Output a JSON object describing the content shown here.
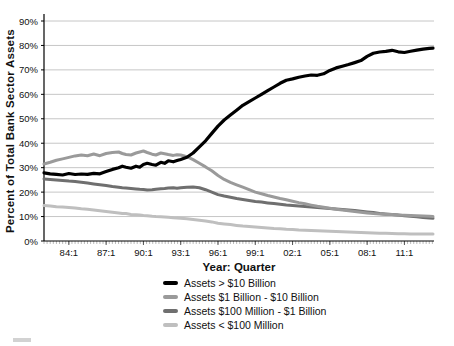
{
  "chart_data": {
    "type": "line",
    "title": "",
    "xlabel": "Year: Quarter",
    "ylabel": "Percent of Total Bank Sector Assets",
    "ylim": [
      0,
      90
    ],
    "y_tick_step": 10,
    "y_tick_labels": [
      "0%",
      "10%",
      "20%",
      "30%",
      "40%",
      "50%",
      "60%",
      "70%",
      "80%",
      "90%"
    ],
    "x_tick_labels": [
      "84:1",
      "87:1",
      "90:1",
      "93:1",
      "96:1",
      "99:1",
      "02:1",
      "05:1",
      "08:1",
      "11:1"
    ],
    "x_tick_values": [
      1984,
      1987,
      1990,
      1993,
      1996,
      1999,
      2002,
      2005,
      2008,
      2011
    ],
    "x_range": [
      1982.0,
      2013.3
    ],
    "grid": "horizontal",
    "legend_position": "bottom",
    "axis_color": "#000000",
    "grid_color": "#c6c6c6",
    "minor_tick_color": "#aaaaaa",
    "x": [
      1982.0,
      1982.5,
      1983.0,
      1983.5,
      1984.0,
      1984.5,
      1985.0,
      1985.5,
      1986.0,
      1986.5,
      1987.0,
      1987.5,
      1988.0,
      1988.3,
      1988.6,
      1989.0,
      1989.4,
      1989.7,
      1990.0,
      1990.3,
      1990.7,
      1991.0,
      1991.4,
      1991.7,
      1992.0,
      1992.4,
      1992.7,
      1993.0,
      1993.5,
      1994.0,
      1994.5,
      1995.0,
      1995.5,
      1996.0,
      1996.5,
      1997.0,
      1997.5,
      1998.0,
      1998.5,
      1999.0,
      1999.5,
      2000.0,
      2000.5,
      2001.0,
      2001.5,
      2002.0,
      2002.5,
      2003.0,
      2003.5,
      2004.0,
      2004.5,
      2005.0,
      2005.5,
      2006.0,
      2006.5,
      2007.0,
      2007.5,
      2008.0,
      2008.5,
      2009.0,
      2009.5,
      2010.0,
      2010.5,
      2011.0,
      2011.5,
      2012.0,
      2012.5,
      2013.0,
      2013.3
    ],
    "series": [
      {
        "name": "Assets > $10 Billion",
        "color": "#000000",
        "width": 3.2,
        "values": [
          27.9,
          27.5,
          27.3,
          27.0,
          27.6,
          27.2,
          27.4,
          27.3,
          27.7,
          27.5,
          28.4,
          29.3,
          30.0,
          30.6,
          30.2,
          29.8,
          30.6,
          30.2,
          31.3,
          31.8,
          31.3,
          31.0,
          32.2,
          31.8,
          32.8,
          32.4,
          32.9,
          33.4,
          34.3,
          36.0,
          38.5,
          41.0,
          44.0,
          47.0,
          49.5,
          51.5,
          53.5,
          55.5,
          57.0,
          58.5,
          60.0,
          61.5,
          63.0,
          64.5,
          65.8,
          66.3,
          67.0,
          67.5,
          67.9,
          67.8,
          68.4,
          69.8,
          70.8,
          71.5,
          72.2,
          73.0,
          73.8,
          75.5,
          76.8,
          77.3,
          77.6,
          78.0,
          77.4,
          77.1,
          77.6,
          78.1,
          78.5,
          78.8,
          78.9
        ]
      },
      {
        "name": "Assets $1 Billion - $10 Billion",
        "color": "#9a9a9a",
        "width": 3.0,
        "values": [
          31.5,
          32.2,
          33.0,
          33.6,
          34.2,
          34.8,
          35.2,
          34.9,
          35.6,
          34.9,
          35.8,
          36.2,
          36.4,
          35.8,
          35.4,
          35.2,
          36.0,
          36.4,
          36.8,
          36.2,
          35.5,
          35.2,
          36.0,
          35.7,
          35.4,
          35.0,
          35.3,
          35.2,
          34.5,
          33.3,
          31.8,
          30.3,
          28.7,
          26.8,
          25.2,
          24.0,
          23.0,
          22.0,
          21.0,
          20.0,
          19.3,
          18.6,
          18.0,
          17.4,
          16.9,
          16.3,
          15.7,
          15.2,
          14.7,
          14.2,
          13.8,
          13.4,
          13.0,
          12.7,
          12.4,
          12.1,
          11.8,
          11.5,
          11.2,
          11.0,
          10.9,
          10.8,
          10.6,
          10.5,
          10.4,
          10.3,
          10.2,
          10.1,
          10.0
        ]
      },
      {
        "name": "Assets $100 Million - $1 Billion",
        "color": "#6f6f6f",
        "width": 3.0,
        "values": [
          25.4,
          25.2,
          25.0,
          24.8,
          24.5,
          24.3,
          24.0,
          23.7,
          23.3,
          23.0,
          22.7,
          22.3,
          22.0,
          21.8,
          21.7,
          21.5,
          21.3,
          21.2,
          21.1,
          20.9,
          21.0,
          21.2,
          21.4,
          21.5,
          21.7,
          21.8,
          21.6,
          21.8,
          22.0,
          22.1,
          21.8,
          21.0,
          20.0,
          19.0,
          18.4,
          17.9,
          17.4,
          17.0,
          16.6,
          16.2,
          15.9,
          15.6,
          15.3,
          15.0,
          14.7,
          14.5,
          14.3,
          14.1,
          13.9,
          13.7,
          13.5,
          13.3,
          13.1,
          12.9,
          12.7,
          12.5,
          12.2,
          11.9,
          11.6,
          11.3,
          11.1,
          10.9,
          10.6,
          10.3,
          10.1,
          9.9,
          9.6,
          9.4,
          9.3
        ]
      },
      {
        "name": "Assets < $100 Million",
        "color": "#bfbfbf",
        "width": 3.0,
        "values": [
          14.5,
          14.3,
          14.0,
          13.9,
          13.7,
          13.5,
          13.2,
          13.0,
          12.7,
          12.4,
          12.1,
          11.8,
          11.5,
          11.3,
          11.2,
          10.9,
          10.7,
          10.6,
          10.4,
          10.3,
          10.1,
          10.0,
          9.9,
          9.8,
          9.7,
          9.5,
          9.4,
          9.3,
          9.1,
          8.8,
          8.5,
          8.2,
          7.8,
          7.3,
          7.0,
          6.7,
          6.4,
          6.1,
          5.9,
          5.7,
          5.5,
          5.3,
          5.1,
          5.0,
          4.8,
          4.7,
          4.5,
          4.4,
          4.3,
          4.2,
          4.1,
          4.0,
          3.9,
          3.8,
          3.7,
          3.6,
          3.5,
          3.4,
          3.3,
          3.2,
          3.2,
          3.1,
          3.0,
          3.0,
          2.9,
          2.9,
          2.9,
          2.9,
          2.9
        ]
      }
    ]
  }
}
